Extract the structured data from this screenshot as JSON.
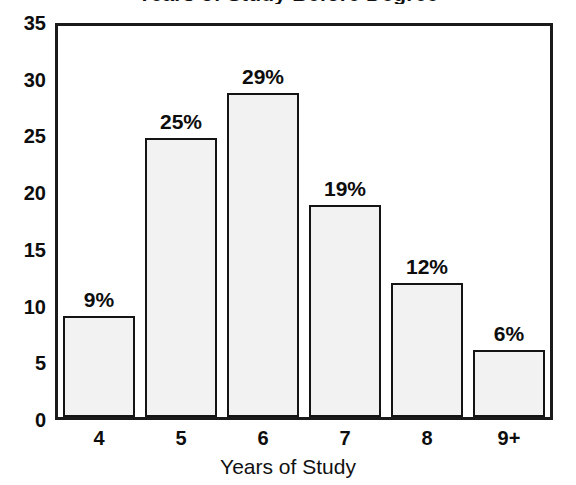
{
  "chart_data": {
    "type": "bar",
    "title": "Years of Study",
    "title_cropped_top": "Years of Study Before Degree",
    "xlabel": "Years of Study",
    "ylabel": "",
    "categories": [
      "4",
      "5",
      "6",
      "7",
      "8",
      "9+"
    ],
    "values": [
      9,
      25,
      29,
      19,
      12,
      6
    ],
    "data_labels": [
      "9%",
      "25%",
      "29%",
      "19%",
      "12%",
      "6%"
    ],
    "ylim": [
      0,
      35
    ],
    "ytick_labels": [
      "0",
      "5",
      "10",
      "15",
      "20",
      "25",
      "30",
      "35"
    ],
    "ytick_values": [
      0,
      5,
      10,
      15,
      20,
      25,
      30,
      35
    ],
    "grid": false,
    "legend": null,
    "bar_fill_color": "#f2f2f2",
    "bar_edge_color": "#141414",
    "axis_color": "#1a1a1a",
    "background_color": "#ffffff"
  }
}
